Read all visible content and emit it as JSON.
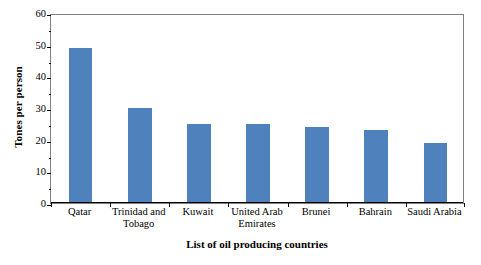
{
  "chart_data": {
    "type": "bar",
    "title": "",
    "xlabel": "List of oil producing countries",
    "ylabel": "Tones per person",
    "categories": [
      "Qatar",
      "Trinidad and Tobago",
      "Kuwait",
      "United Arab Emirates",
      "Brunei",
      "Bahrain",
      "Saudi Arabia"
    ],
    "values": [
      49,
      30,
      25,
      25,
      24,
      23,
      19
    ],
    "ylim": [
      0,
      60
    ],
    "ytick_labels": [
      "0",
      "10",
      "20",
      "30",
      "40",
      "50",
      "60"
    ],
    "ytick_values": [
      0,
      10,
      20,
      30,
      40,
      50,
      60
    ],
    "yminor_values": [
      5,
      15,
      25,
      35,
      45,
      55
    ],
    "grid": false,
    "legend": false,
    "bar_color": "#4F81BD",
    "frame_color": "#808080",
    "axis_color": "#000000",
    "background": "#FFFFFF"
  }
}
